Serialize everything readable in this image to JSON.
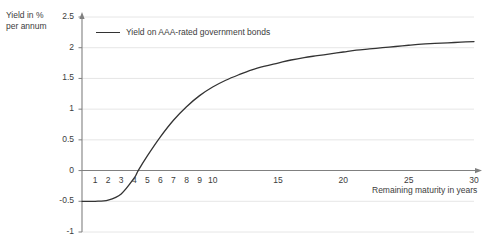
{
  "chart_data": {
    "type": "line",
    "title": "",
    "xlabel": "Remaining maturity in years",
    "ylabel": "Yield in %",
    "ylabel_line2": "per annum",
    "xlim": [
      0,
      30
    ],
    "ylim": [
      -1,
      2.5
    ],
    "grid": true,
    "legend_position": "top-left",
    "xticks": [
      1,
      2,
      3,
      4,
      5,
      6,
      7,
      8,
      9,
      10,
      15,
      20,
      25,
      30
    ],
    "xtick_labels": [
      "1",
      "2",
      "3",
      "4",
      "5",
      "6",
      "7",
      "8",
      "9",
      "10",
      "15",
      "20",
      "25",
      "30"
    ],
    "yticks": [
      2.5,
      2,
      1.5,
      1,
      0.5,
      0,
      -0.5,
      -1
    ],
    "ytick_labels": [
      "2.5",
      "2",
      "1.5",
      "1",
      "0.5",
      "0",
      "-0.5",
      "-1"
    ],
    "series": [
      {
        "name": "Yield on AAA-rated government bonds",
        "color": "#333333",
        "x": [
          0,
          1,
          2,
          3,
          4,
          4.3,
          5,
          6,
          7,
          8,
          9,
          10,
          11,
          12,
          13,
          14,
          15,
          16,
          17,
          18,
          19,
          20,
          21,
          22,
          23,
          24,
          25,
          26,
          27,
          28,
          29,
          30
        ],
        "values": [
          -0.5,
          -0.5,
          -0.48,
          -0.38,
          -0.12,
          0,
          0.24,
          0.55,
          0.82,
          1.04,
          1.22,
          1.36,
          1.47,
          1.56,
          1.64,
          1.7,
          1.75,
          1.8,
          1.84,
          1.87,
          1.9,
          1.93,
          1.96,
          1.98,
          2.0,
          2.02,
          2.04,
          2.06,
          2.07,
          2.08,
          2.09,
          2.1
        ]
      }
    ]
  },
  "legend": {
    "label": "Yield on AAA-rated government bonds"
  },
  "colors": {
    "line": "#333333",
    "axis": "#808080",
    "grid": "#e6e6e6",
    "text": "#3c3c3c",
    "background": "#ffffff"
  }
}
